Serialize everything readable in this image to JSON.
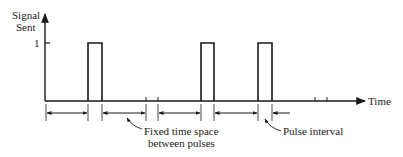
{
  "diagram": {
    "type": "pulse-timing-diagram",
    "y_axis": {
      "label_line1": "Signal",
      "label_line2": "Sent",
      "tick_label": "1"
    },
    "x_axis": {
      "label": "Time"
    },
    "pulses": [
      {
        "index": 1,
        "height": 1
      },
      {
        "index": 2,
        "height": 1
      },
      {
        "index": 3,
        "height": 1
      }
    ],
    "annotations": {
      "fixed_space_line1": "Fixed time space",
      "fixed_space_line2": "between pulses",
      "pulse_interval": "Pulse interval"
    },
    "colors": {
      "ink": "#1a1a1a",
      "background": "#ffffff"
    }
  }
}
